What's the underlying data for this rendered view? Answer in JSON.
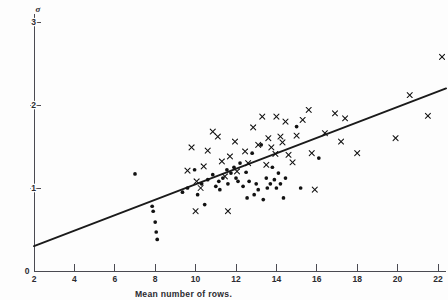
{
  "chart_data": {
    "type": "scatter",
    "title": "",
    "xlabel": "Mean number of rows.",
    "ylabel": "σ",
    "xlim": [
      2,
      22
    ],
    "ylim": [
      0,
      3
    ],
    "xticks": [
      2,
      4,
      6,
      8,
      10,
      12,
      14,
      16,
      18,
      20,
      22
    ],
    "xtick_labels": [
      "2",
      "4",
      "6",
      "8",
      "10",
      "12",
      "14",
      "16",
      "18",
      "20",
      "22"
    ],
    "yticks": [
      0,
      1,
      2,
      3
    ],
    "ytick_labels": [
      "0",
      "1",
      "2",
      "3"
    ],
    "grid": false,
    "legend": "none",
    "series": [
      {
        "name": "dot-series",
        "marker": "dot",
        "color": "#121212",
        "points": [
          [
            7.0,
            1.17
          ],
          [
            7.85,
            0.78
          ],
          [
            7.9,
            0.72
          ],
          [
            8.0,
            0.59
          ],
          [
            8.05,
            0.47
          ],
          [
            8.1,
            0.38
          ],
          [
            9.35,
            0.95
          ],
          [
            9.6,
            1.0
          ],
          [
            9.95,
            1.22
          ],
          [
            10.1,
            0.92
          ],
          [
            10.3,
            1.05
          ],
          [
            10.45,
            0.8
          ],
          [
            10.6,
            1.1
          ],
          [
            10.85,
            1.16
          ],
          [
            11.0,
            1.02
          ],
          [
            11.15,
            1.08
          ],
          [
            11.2,
            0.98
          ],
          [
            11.35,
            1.12
          ],
          [
            11.55,
            1.22
          ],
          [
            11.6,
            1.05
          ],
          [
            11.75,
            1.18
          ],
          [
            11.9,
            1.25
          ],
          [
            12.0,
            1.12
          ],
          [
            12.1,
            1.08
          ],
          [
            12.2,
            1.3
          ],
          [
            12.35,
            1.02
          ],
          [
            12.5,
            1.19
          ],
          [
            12.55,
            0.88
          ],
          [
            12.65,
            1.08
          ],
          [
            12.8,
            1.42
          ],
          [
            12.9,
            0.92
          ],
          [
            13.0,
            1.05
          ],
          [
            13.1,
            0.98
          ],
          [
            13.25,
            1.52
          ],
          [
            13.35,
            0.86
          ],
          [
            13.5,
            1.12
          ],
          [
            13.55,
            1.0
          ],
          [
            13.7,
            1.05
          ],
          [
            13.8,
            1.25
          ],
          [
            13.9,
            1.1
          ],
          [
            14.0,
            1.0
          ],
          [
            14.1,
            1.18
          ],
          [
            14.2,
            1.05
          ],
          [
            14.35,
            0.88
          ],
          [
            14.45,
            1.12
          ],
          [
            15.0,
            1.74
          ],
          [
            15.2,
            1.0
          ],
          [
            16.1,
            1.36
          ]
        ]
      },
      {
        "name": "cross-series",
        "marker": "cross",
        "color": "#121212",
        "points": [
          [
            9.6,
            1.21
          ],
          [
            9.8,
            1.49
          ],
          [
            10.0,
            0.72
          ],
          [
            10.05,
            1.08
          ],
          [
            10.25,
            1.0
          ],
          [
            10.4,
            1.26
          ],
          [
            10.6,
            1.45
          ],
          [
            10.85,
            1.68
          ],
          [
            11.1,
            1.62
          ],
          [
            11.3,
            1.32
          ],
          [
            11.45,
            1.14
          ],
          [
            11.6,
            0.72
          ],
          [
            11.7,
            1.38
          ],
          [
            11.95,
            1.56
          ],
          [
            12.05,
            1.2
          ],
          [
            12.45,
            1.44
          ],
          [
            12.6,
            1.3
          ],
          [
            12.85,
            1.73
          ],
          [
            13.1,
            1.52
          ],
          [
            13.3,
            1.86
          ],
          [
            13.5,
            1.28
          ],
          [
            13.6,
            1.6
          ],
          [
            13.75,
            1.49
          ],
          [
            13.95,
            1.41
          ],
          [
            14.0,
            1.86
          ],
          [
            14.2,
            1.62
          ],
          [
            14.3,
            1.55
          ],
          [
            14.45,
            1.8
          ],
          [
            14.6,
            1.4
          ],
          [
            14.8,
            1.31
          ],
          [
            15.0,
            1.63
          ],
          [
            15.3,
            1.82
          ],
          [
            15.6,
            1.94
          ],
          [
            15.75,
            1.42
          ],
          [
            15.9,
            0.98
          ],
          [
            16.4,
            1.66
          ],
          [
            16.9,
            1.9
          ],
          [
            17.2,
            1.56
          ],
          [
            17.4,
            1.84
          ],
          [
            18.0,
            1.42
          ],
          [
            19.9,
            1.6
          ],
          [
            20.6,
            2.12
          ],
          [
            21.5,
            1.87
          ],
          [
            22.2,
            2.58
          ]
        ]
      }
    ],
    "fit_line": {
      "name": "regression-line",
      "x0": 2.0,
      "y0": 0.3,
      "x1": 22.4,
      "y1": 2.2,
      "color": "#1a1a1a"
    }
  }
}
